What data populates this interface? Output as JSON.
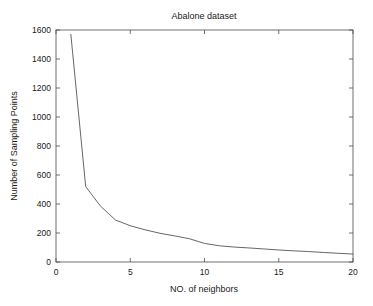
{
  "chart_data": {
    "type": "line",
    "title": "Abalone dataset",
    "xlabel": "NO. of neighbors",
    "ylabel": "Number of Sampling Points",
    "xlim": [
      0,
      20
    ],
    "ylim": [
      0,
      1600
    ],
    "xticks": [
      0,
      5,
      10,
      15,
      20
    ],
    "yticks": [
      0,
      200,
      400,
      600,
      800,
      1000,
      1200,
      1400,
      1600
    ],
    "xtick_labels": [
      "0",
      "5",
      "10",
      "15",
      "20"
    ],
    "ytick_labels": [
      "0",
      "200",
      "400",
      "600",
      "800",
      "1000",
      "1200",
      "1400",
      "1600"
    ],
    "grid": false,
    "legend": null,
    "legend_position": "none",
    "line_color": "#555555",
    "series": [
      {
        "name": "Number of Sampling Points",
        "x": [
          1,
          2,
          3,
          4,
          5,
          6,
          7,
          8,
          9,
          10,
          11,
          12,
          13,
          14,
          15,
          16,
          17,
          18,
          19,
          20
        ],
        "values": [
          1570,
          520,
          385,
          290,
          250,
          222,
          198,
          180,
          160,
          128,
          112,
          103,
          97,
          90,
          83,
          77,
          72,
          66,
          60,
          55
        ]
      }
    ]
  }
}
